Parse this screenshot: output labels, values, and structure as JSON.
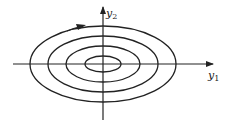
{
  "diagram": {
    "type": "phase-portrait",
    "axes": {
      "x_label": "y",
      "x_subscript": "1",
      "y_label": "y",
      "y_subscript": "2"
    },
    "orbit_count": 4,
    "direction": "clockwise",
    "colors": {
      "stroke": "#222222",
      "background": "#ffffff"
    }
  }
}
